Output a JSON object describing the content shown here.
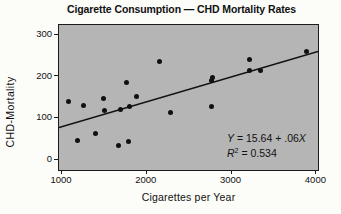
{
  "chart_data": {
    "type": "scatter",
    "title": "Cigarette Consumption — CHD Mortality Rates",
    "xlabel": "Cigarettes per Year",
    "ylabel": "CHD-Mortality",
    "grid": false,
    "legend": "none",
    "x_axis": {
      "min": 1000,
      "max": 4000,
      "ticks": [
        {
          "value": 1000,
          "label": "1000"
        },
        {
          "value": 2000,
          "label": "2000"
        },
        {
          "value": 3000,
          "label": "3000"
        },
        {
          "value": 4000,
          "label": "4000"
        }
      ]
    },
    "y_axis": {
      "min": 0,
      "max": 300,
      "ticks": [
        {
          "value": 0,
          "label": "0"
        },
        {
          "value": 100,
          "label": "100"
        },
        {
          "value": 200,
          "label": "200"
        },
        {
          "value": 300,
          "label": "300"
        }
      ]
    },
    "points": [
      {
        "x": 3900,
        "y": 256.9
      },
      {
        "x": 3350,
        "y": 211.6
      },
      {
        "x": 3220,
        "y": 238.1
      },
      {
        "x": 3220,
        "y": 211.8
      },
      {
        "x": 2790,
        "y": 194.1
      },
      {
        "x": 2780,
        "y": 124.5
      },
      {
        "x": 2770,
        "y": 187.3
      },
      {
        "x": 2290,
        "y": 110.5
      },
      {
        "x": 2160,
        "y": 233.1
      },
      {
        "x": 1890,
        "y": 150.3
      },
      {
        "x": 1810,
        "y": 124.7
      },
      {
        "x": 1800,
        "y": 41.2
      },
      {
        "x": 1770,
        "y": 182.1
      },
      {
        "x": 1700,
        "y": 118.1
      },
      {
        "x": 1680,
        "y": 31.9
      },
      {
        "x": 1510,
        "y": 114.3
      },
      {
        "x": 1500,
        "y": 144.9
      },
      {
        "x": 1410,
        "y": 59.7
      },
      {
        "x": 1270,
        "y": 126.9
      },
      {
        "x": 1200,
        "y": 43.9
      },
      {
        "x": 1090,
        "y": 136.3
      }
    ],
    "regression": {
      "intercept": 15.64,
      "slope": 0.06
    },
    "annotation": {
      "lines": [
        {
          "segments": [
            {
              "text": "Y",
              "italic": true
            },
            {
              "text": " = 15.64 + .06",
              "italic": false
            },
            {
              "text": "X",
              "italic": true
            }
          ]
        },
        {
          "segments": [
            {
              "text": "R",
              "italic": true
            },
            {
              "text": "2",
              "italic": false,
              "sup": true
            },
            {
              "text": " = 0.534",
              "italic": false
            }
          ]
        }
      ]
    },
    "colors": {
      "plot_background": "#b5b5b5",
      "point": "#101010",
      "regression_line": "#101010",
      "text": "#111111"
    }
  }
}
